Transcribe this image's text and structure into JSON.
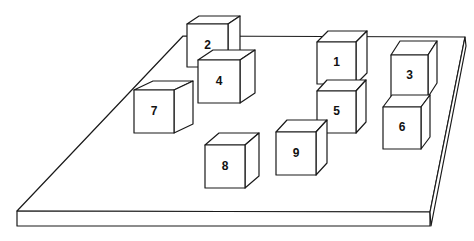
{
  "figure": {
    "colors": {
      "background": "#ffffff",
      "stroke": "#1a1a1a",
      "text": "#111111"
    }
  },
  "board": {
    "top_face": [
      [
        183,
        36
      ],
      [
        465,
        37
      ],
      [
        430,
        212
      ],
      [
        17,
        211
      ]
    ],
    "front_face": [
      [
        17,
        211
      ],
      [
        430,
        212
      ],
      [
        430,
        226
      ],
      [
        17,
        226
      ]
    ],
    "right_face": [
      [
        430,
        212
      ],
      [
        465,
        37
      ],
      [
        466,
        46
      ],
      [
        431,
        226
      ]
    ]
  },
  "cubes": [
    {
      "label": "2",
      "front": {
        "x": 187,
        "y": 24,
        "w": 41,
        "h": 43
      },
      "depth": {
        "dx": 12,
        "dy": -8
      }
    },
    {
      "label": "1",
      "front": {
        "x": 317,
        "y": 42,
        "w": 39,
        "h": 42
      },
      "depth": {
        "dx": 11,
        "dy": -11
      }
    },
    {
      "label": "3",
      "front": {
        "x": 391,
        "y": 55,
        "w": 37,
        "h": 42
      },
      "depth": {
        "dx": 9,
        "dy": -14
      }
    },
    {
      "label": "4",
      "front": {
        "x": 198,
        "y": 60,
        "w": 42,
        "h": 43
      },
      "depth": {
        "dx": 15,
        "dy": -10
      }
    },
    {
      "label": "7",
      "front": {
        "x": 134,
        "y": 90,
        "w": 40,
        "h": 43
      },
      "depth": {
        "dx": 19,
        "dy": -9
      }
    },
    {
      "label": "5",
      "front": {
        "x": 317,
        "y": 91,
        "w": 39,
        "h": 42
      },
      "depth": {
        "dx": 10,
        "dy": -11
      }
    },
    {
      "label": "6",
      "front": {
        "x": 383,
        "y": 107,
        "w": 38,
        "h": 42
      },
      "depth": {
        "dx": 9,
        "dy": -12
      }
    },
    {
      "label": "9",
      "front": {
        "x": 276,
        "y": 132,
        "w": 40,
        "h": 43
      },
      "depth": {
        "dx": 11,
        "dy": -12
      }
    },
    {
      "label": "8",
      "front": {
        "x": 205,
        "y": 145,
        "w": 40,
        "h": 43
      },
      "depth": {
        "dx": 14,
        "dy": -12
      }
    }
  ]
}
